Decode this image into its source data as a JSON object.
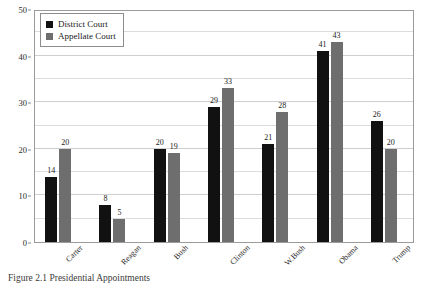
{
  "chart_data": {
    "type": "bar",
    "title": "",
    "subtitle": "",
    "xlabel": "",
    "ylabel": "",
    "ylim": [
      0,
      50
    ],
    "yticks": [
      0,
      10,
      20,
      30,
      40,
      50
    ],
    "minor_gridlines": [
      5,
      15,
      25,
      35,
      45
    ],
    "grid": true,
    "legend_position": "top-left",
    "categories": [
      "Carter",
      "Reagan",
      "Bush",
      "Clinton",
      "W.Bush",
      "Obama",
      "Trump"
    ],
    "series": [
      {
        "name": "District Court",
        "color": "#111111",
        "values": [
          14,
          8,
          20,
          29,
          21,
          41,
          26
        ]
      },
      {
        "name": "Appellate Court",
        "color": "#6e6e6e",
        "values": [
          20,
          5,
          19,
          33,
          28,
          43,
          20
        ]
      }
    ],
    "data_labels": true
  },
  "legend": {
    "items": [
      {
        "label": "District Court",
        "swatch": "district"
      },
      {
        "label": "Appellate Court",
        "swatch": "appellate"
      }
    ]
  },
  "yaxis": {
    "ticks": [
      "0",
      "10",
      "20",
      "30",
      "40",
      "50"
    ]
  },
  "caption": {
    "text": "Figure 2.1  Presidential Appointments"
  }
}
